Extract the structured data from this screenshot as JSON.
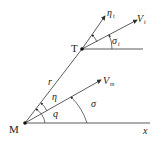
{
  "diagram": {
    "points": {
      "missile": {
        "label": "M",
        "x": 25,
        "y": 123
      },
      "target": {
        "label": "T",
        "x": 82,
        "y": 49
      }
    },
    "labels": {
      "line_of_sight": "r",
      "x_axis": "x",
      "missile_velocity": "V",
      "missile_velocity_sub": "m",
      "target_velocity": "V",
      "target_velocity_sub": "t",
      "target_lead_angle": "η",
      "target_lead_angle_sub": "t",
      "target_heading": "σ",
      "target_heading_sub": "t",
      "missile_lead_angle": "η",
      "los_angle": "q",
      "missile_heading": "σ"
    },
    "colors": {
      "line": "#333333",
      "text": "#222222",
      "background": "#ffffff"
    }
  }
}
